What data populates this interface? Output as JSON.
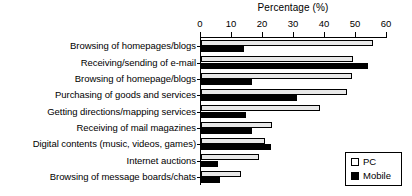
{
  "chart_data": {
    "type": "bar",
    "orientation": "horizontal",
    "title": "Percentage (%)",
    "xlabel": "Percentage (%)",
    "ylabel": "",
    "xlim": [
      0,
      60
    ],
    "xticks": [
      0,
      10,
      20,
      30,
      40,
      50,
      60
    ],
    "grid": false,
    "legend_position": "bottom-right",
    "categories": [
      "Browsing of homepages/blogs",
      "Receiving/sending of e-mail",
      "Browsing of homepage/blogs",
      "Purchasing of goods and services",
      "Getting directions/mapping services",
      "Receiving of mail magazines",
      "Digital contents (music, videos, games)",
      "Internet auctions",
      "Browsing of message boards/chats"
    ],
    "series": [
      {
        "name": "PC",
        "color": "#e8e8e8",
        "values": [
          55.5,
          49.0,
          48.7,
          47.0,
          38.4,
          23.0,
          20.6,
          18.7,
          13.0
        ]
      },
      {
        "name": "Mobile",
        "color": "#000000",
        "values": [
          14.0,
          54.0,
          16.5,
          31.0,
          14.5,
          16.5,
          22.6,
          5.5,
          6.0
        ]
      }
    ]
  },
  "legend": {
    "entries": [
      {
        "label": "PC",
        "swatch": "pc-swatch"
      },
      {
        "label": "Mobile",
        "swatch": "mobile-swatch"
      }
    ]
  }
}
